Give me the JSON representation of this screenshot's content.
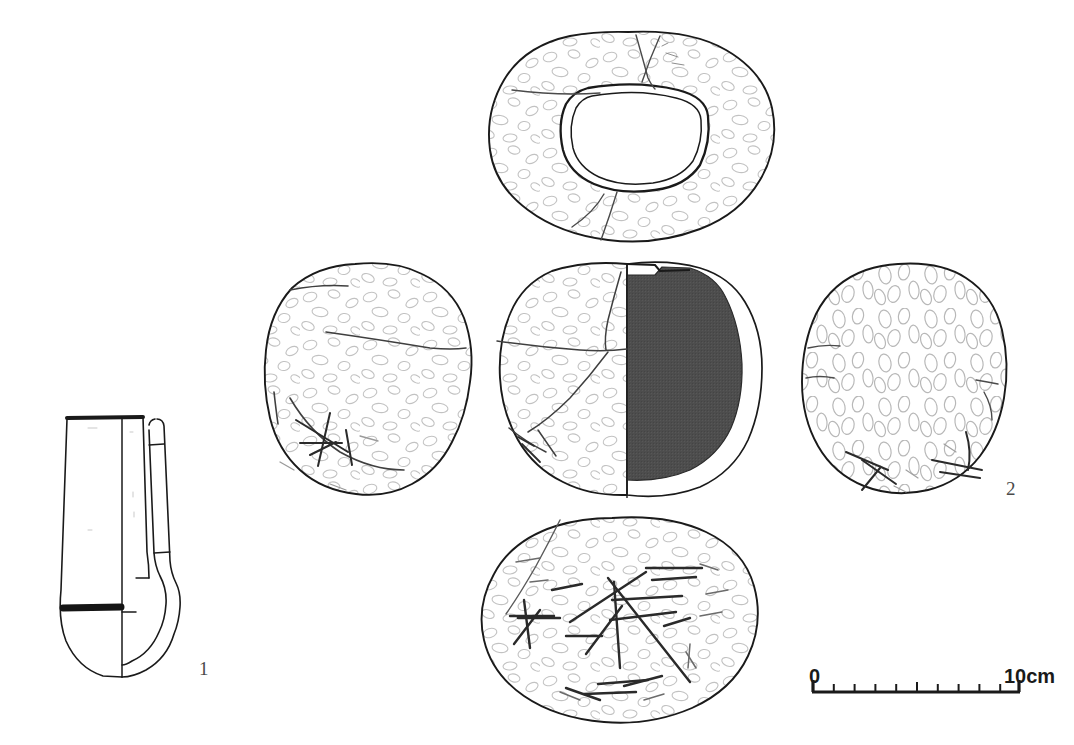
{
  "figure": {
    "type": "archaeological-line-drawing",
    "background_color": "#ffffff",
    "ink_color": "#1a1a1a",
    "section_fill_color": "#4d4d4d",
    "faint_texture_color": "#b0b0b0",
    "label_color": "#4a4a4a"
  },
  "labels": {
    "item_1": "1",
    "item_2": "2"
  },
  "scale_bar": {
    "start_label": "0",
    "end_label": "10cm",
    "unit": "cm",
    "total_length_cm": 10,
    "divisions": 10,
    "x_start_px": 812,
    "x_end_px": 1020,
    "y_px": 692
  },
  "objects": [
    {
      "id": "1",
      "name": "socketed-implement-profile",
      "views": [
        "longitudinal-profile-with-half-section"
      ],
      "position": {
        "x": 60,
        "y": 410,
        "width": 130,
        "height": 270
      },
      "description": "Tapering shafted implement, half-section on right, dark band near base and solid rim line at top"
    },
    {
      "id": "2",
      "name": "perforated-stone-ring",
      "views": [
        "top-view",
        "left-side-view",
        "front-view-half-section",
        "right-side-view",
        "bottom-view"
      ],
      "description": "Annular pecked stone with central perforation; front view shows right half as solid dark section; bottom view shows heavy incised striations"
    }
  ],
  "views": {
    "top": {
      "name": "top-view",
      "center_x": 632,
      "center_y": 133
    },
    "left": {
      "name": "left-side-view",
      "center_x": 363,
      "center_y": 383
    },
    "center": {
      "name": "front-view-half-section",
      "center_x": 627,
      "center_y": 383
    },
    "right": {
      "name": "right-side-view",
      "center_x": 898,
      "center_y": 383
    },
    "bottom": {
      "name": "bottom-view",
      "center_x": 617,
      "center_y": 625
    },
    "profile": {
      "name": "profile-view-item-1",
      "center_x": 122,
      "center_y": 545
    }
  }
}
